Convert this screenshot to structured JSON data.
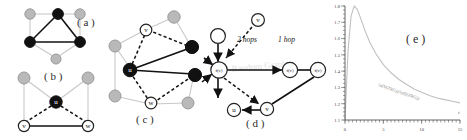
{
  "figure": {
    "panels": [
      {
        "id": "a",
        "label": "( a )"
      },
      {
        "id": "b",
        "label": "( b )"
      },
      {
        "id": "c",
        "label": "( c )"
      },
      {
        "id": "d",
        "label": "( d )"
      },
      {
        "id": "e",
        "label": "( e )"
      }
    ]
  },
  "panel_a": {
    "label": "( a )",
    "nodes": [
      {
        "name": "top-left-gray",
        "fill": "gray",
        "text": ""
      },
      {
        "name": "top-center-black",
        "fill": "black",
        "text": ""
      },
      {
        "name": "top-right-gray",
        "fill": "gray",
        "text": ""
      },
      {
        "name": "mid-left-black",
        "fill": "black",
        "text": ""
      },
      {
        "name": "mid-right-black",
        "fill": "black",
        "text": ""
      },
      {
        "name": "bottom-gray",
        "fill": "gray",
        "text": ""
      }
    ]
  },
  "panel_b": {
    "label": "( b )",
    "nodes": [
      {
        "name": "top-left-gray",
        "fill": "gray",
        "text": ""
      },
      {
        "name": "top-right-gray",
        "fill": "gray",
        "text": ""
      },
      {
        "name": "center-black",
        "fill": "black",
        "text": "u"
      },
      {
        "name": "bottom-left-white",
        "fill": "white",
        "text": "v"
      },
      {
        "name": "bottom-right-white",
        "fill": "white",
        "text": "w"
      }
    ]
  },
  "panel_c": {
    "label": "( c )",
    "nodes": [
      {
        "name": "node-u",
        "fill": "black",
        "text": "u"
      },
      {
        "name": "node-v",
        "fill": "white",
        "text": "v"
      },
      {
        "name": "node-w",
        "fill": "white",
        "text": "w"
      },
      {
        "name": "black-upper-right",
        "fill": "black",
        "text": ""
      },
      {
        "name": "black-lower-right",
        "fill": "black",
        "text": ""
      },
      {
        "name": "gray-top-right",
        "fill": "gray",
        "text": ""
      },
      {
        "name": "gray-left",
        "fill": "gray",
        "text": ""
      },
      {
        "name": "gray-bottom-left",
        "fill": "gray",
        "text": ""
      },
      {
        "name": "gray-bottom-right",
        "fill": "gray",
        "text": ""
      }
    ]
  },
  "panel_d": {
    "label": "( d )",
    "annotations": {
      "two_hops": "2 hops",
      "one_hop": "1 hop"
    },
    "watermark": "Random Graph",
    "nodes": [
      {
        "name": "source-white",
        "fill": "white",
        "text": ""
      },
      {
        "name": "top-v",
        "fill": "white",
        "text": "v"
      },
      {
        "name": "center-fv",
        "fill": "white",
        "text": "f(v)"
      },
      {
        "name": "right-fv",
        "fill": "white",
        "text": "f(v)"
      },
      {
        "name": "far-right-fv",
        "fill": "white",
        "text": "f(v)"
      },
      {
        "name": "bottom-u",
        "fill": "white",
        "text": "u"
      },
      {
        "name": "bottom-v",
        "fill": "white",
        "text": "v"
      }
    ]
  },
  "chart_data": {
    "type": "line",
    "title": "( e )",
    "xlabel": "t",
    "ylabel": "",
    "curve_annotation": "ln(N(ZRG))/ln(E(ZRG))",
    "xlim": [
      0,
      15
    ],
    "ylim": [
      1.1,
      1.8
    ],
    "xticks": [
      0,
      5,
      10,
      15
    ],
    "yticks": [
      1.1,
      1.2,
      1.3,
      1.4,
      1.5,
      1.6,
      1.7,
      1.8
    ],
    "grid": false,
    "legend": "none",
    "x": [
      0.0,
      0.4,
      0.8,
      1.2,
      1.6,
      2.0,
      2.6,
      3.2,
      4.0,
      5.0,
      6.0,
      7.0,
      8.0,
      9.0,
      10.0,
      11.0,
      12.0,
      13.0,
      14.0,
      15.0
    ],
    "y": [
      1.1,
      1.53,
      1.74,
      1.8,
      1.78,
      1.73,
      1.65,
      1.58,
      1.51,
      1.44,
      1.39,
      1.35,
      1.32,
      1.29,
      1.27,
      1.25,
      1.235,
      1.225,
      1.215,
      1.205
    ]
  }
}
